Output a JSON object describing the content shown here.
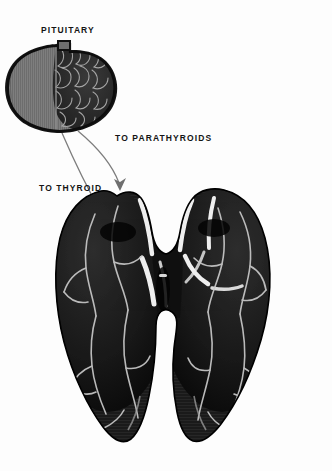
{
  "figure": {
    "background_color": "#fdfdfd"
  },
  "labels": {
    "pituitary": "PITUITARY",
    "parathyroids": "TO  PARATHYROIDS",
    "thyroid": "TO  THYROID"
  },
  "colors": {
    "label_text": "#141414",
    "outline": "#111111",
    "pituitary_anterior_gray": "#7b7b7b",
    "pituitary_posterior_dark": "#2a2a2a",
    "pituitary_cell_border": "#9a9a9a",
    "thyroid_body": "#191919",
    "thyroid_shadow": "#050505",
    "thyroid_highlight": "#f2f2f2",
    "leader_line": "#7d7d7d"
  },
  "structures": {
    "pituitary": {
      "name": "pituitary-gland",
      "description": "bean shaped gland with superior stalk, hatched anterior lobe at left and dark lobulated posterior region at right"
    },
    "thyroid": {
      "name": "thyroid-gland",
      "description": "dark butterfly shaped gland with left and right lobes joined by a central isthmus, tapering to inferior poles"
    }
  },
  "pointers": [
    {
      "name": "parathyroids-leader",
      "target": "to-parathyroids",
      "arrow_tip": {
        "x": 120,
        "y": 190
      }
    },
    {
      "name": "thyroid-leader",
      "target": "to-thyroid",
      "arrow_tip": {
        "x": 104,
        "y": 219
      }
    }
  ]
}
